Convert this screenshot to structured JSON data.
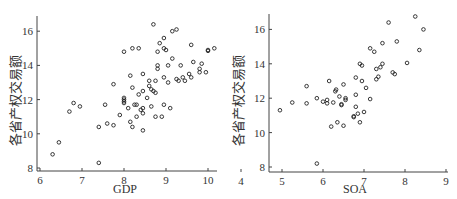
{
  "chart_data": [
    {
      "type": "scatter",
      "title": "",
      "xlabel": "GDP",
      "ylabel": "各省产权交易额",
      "xlim": [
        6,
        10.2
      ],
      "ylim": [
        7.9,
        16.9
      ],
      "xticks": [
        6,
        7,
        8,
        9,
        10
      ],
      "yticks": [
        8,
        10,
        12,
        14,
        16
      ],
      "grid": false,
      "legend": null,
      "points": [
        [
          6.3,
          8.8
        ],
        [
          6.45,
          9.5
        ],
        [
          6.7,
          11.3
        ],
        [
          6.8,
          11.8
        ],
        [
          6.95,
          11.6
        ],
        [
          7.4,
          10.4
        ],
        [
          7.4,
          8.3
        ],
        [
          7.55,
          11.7
        ],
        [
          7.6,
          10.6
        ],
        [
          7.75,
          12.9
        ],
        [
          7.75,
          10.5
        ],
        [
          7.9,
          11.1
        ],
        [
          8.0,
          14.8
        ],
        [
          8.0,
          12.1
        ],
        [
          8.0,
          12.0
        ],
        [
          8.0,
          11.9
        ],
        [
          8.0,
          11.8
        ],
        [
          8.1,
          11.5
        ],
        [
          8.15,
          13.4
        ],
        [
          8.15,
          10.7
        ],
        [
          8.2,
          15.0
        ],
        [
          8.2,
          12.7
        ],
        [
          8.2,
          10.4
        ],
        [
          8.25,
          11.7
        ],
        [
          8.3,
          11.7
        ],
        [
          8.3,
          11.0
        ],
        [
          8.35,
          15.0
        ],
        [
          8.35,
          12.3
        ],
        [
          8.4,
          11.4
        ],
        [
          8.45,
          13.5
        ],
        [
          8.45,
          12.5
        ],
        [
          8.45,
          11.5
        ],
        [
          8.45,
          11.2
        ],
        [
          8.45,
          10.2
        ],
        [
          8.55,
          12.1
        ],
        [
          8.6,
          13.1
        ],
        [
          8.6,
          12.8
        ],
        [
          8.65,
          12.6
        ],
        [
          8.65,
          11.6
        ],
        [
          8.7,
          16.4
        ],
        [
          8.7,
          12.5
        ],
        [
          8.75,
          13.1
        ],
        [
          8.75,
          12.4
        ],
        [
          8.75,
          11.0
        ],
        [
          8.8,
          14.8
        ],
        [
          8.8,
          14.0
        ],
        [
          8.8,
          13.8
        ],
        [
          8.85,
          15.3
        ],
        [
          8.9,
          11.0
        ],
        [
          8.95,
          15.6
        ],
        [
          8.95,
          15.0
        ],
        [
          8.95,
          13.3
        ],
        [
          8.95,
          11.7
        ],
        [
          9.0,
          14.9
        ],
        [
          9.05,
          13.0
        ],
        [
          9.05,
          14.0
        ],
        [
          9.1,
          11.5
        ],
        [
          9.15,
          16.0
        ],
        [
          9.15,
          14.4
        ],
        [
          9.25,
          16.1
        ],
        [
          9.25,
          13.2
        ],
        [
          9.3,
          13.1
        ],
        [
          9.35,
          14.0
        ],
        [
          9.4,
          13.3
        ],
        [
          9.45,
          13.1
        ],
        [
          9.55,
          13.5
        ],
        [
          9.6,
          15.2
        ],
        [
          9.6,
          13.3
        ],
        [
          9.65,
          14.2
        ],
        [
          9.8,
          13.8
        ],
        [
          9.8,
          13.6
        ],
        [
          9.85,
          14.1
        ],
        [
          9.95,
          13.6
        ],
        [
          10.0,
          14.9
        ],
        [
          10.0,
          14.85
        ],
        [
          10.15,
          15.0
        ]
      ]
    },
    {
      "type": "scatter",
      "title": "",
      "xlabel": "SOA",
      "ylabel": "各省产权交易额",
      "xlim": [
        4,
        9
      ],
      "ylim": [
        7.8,
        17.0
      ],
      "xticks": [
        4,
        5,
        6,
        7,
        8,
        9
      ],
      "yticks": [
        8,
        10,
        12,
        14,
        16
      ],
      "grid": false,
      "legend": null,
      "points": [
        [
          4.95,
          11.3
        ],
        [
          5.25,
          11.75
        ],
        [
          5.6,
          12.7
        ],
        [
          5.6,
          11.7
        ],
        [
          5.85,
          12.0
        ],
        [
          5.85,
          8.2
        ],
        [
          6.0,
          11.8
        ],
        [
          6.1,
          11.7
        ],
        [
          6.1,
          11.9
        ],
        [
          6.15,
          13.0
        ],
        [
          6.2,
          10.35
        ],
        [
          6.25,
          11.75
        ],
        [
          6.3,
          12.4
        ],
        [
          6.32,
          12.5
        ],
        [
          6.35,
          10.6
        ],
        [
          6.4,
          12.1
        ],
        [
          6.45,
          11.65
        ],
        [
          6.45,
          11.6
        ],
        [
          6.5,
          12.8
        ],
        [
          6.5,
          10.4
        ],
        [
          6.55,
          12.0
        ],
        [
          6.55,
          11.9
        ],
        [
          6.75,
          10.95
        ],
        [
          6.75,
          10.9
        ],
        [
          6.8,
          13.2
        ],
        [
          6.8,
          12.2
        ],
        [
          6.8,
          11.5
        ],
        [
          6.85,
          11.1
        ],
        [
          6.9,
          14.0
        ],
        [
          6.9,
          10.6
        ],
        [
          6.95,
          13.9
        ],
        [
          6.95,
          13.0
        ],
        [
          7.0,
          11.2
        ],
        [
          7.05,
          12.6
        ],
        [
          7.15,
          14.9
        ],
        [
          7.15,
          11.95
        ],
        [
          7.25,
          14.7
        ],
        [
          7.3,
          13.7
        ],
        [
          7.3,
          13.1
        ],
        [
          7.35,
          13.25
        ],
        [
          7.4,
          13.8
        ],
        [
          7.45,
          15.2
        ],
        [
          7.45,
          14.0
        ],
        [
          7.6,
          16.4
        ],
        [
          7.7,
          13.5
        ],
        [
          7.75,
          13.4
        ],
        [
          7.8,
          15.3
        ],
        [
          8.05,
          14.05
        ],
        [
          8.25,
          16.75
        ],
        [
          8.35,
          14.8
        ],
        [
          8.45,
          16.0
        ]
      ]
    }
  ]
}
